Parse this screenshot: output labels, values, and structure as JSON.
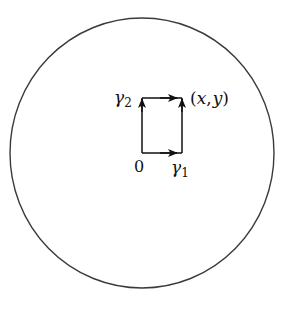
{
  "diagram": {
    "type": "path-integration-rectangle-in-disk",
    "colors": {
      "stroke": "#2a2a2a",
      "background": "#ffffff"
    },
    "disk": {
      "cx": 142,
      "cy": 153,
      "rx": 132,
      "ry": 135
    },
    "rectangle": {
      "x0": 142,
      "y0": 153,
      "x1": 182,
      "y1": 98
    },
    "labels": {
      "origin": "0",
      "gamma1": "γ",
      "gamma1_sub": "1",
      "gamma2": "γ",
      "gamma2_sub": "2",
      "point_open": "(",
      "point_x": "x",
      "point_comma": ",",
      "point_y": "y",
      "point_close": ")"
    },
    "paths": [
      {
        "name": "gamma1",
        "segments": [
          "0 → right along bottom",
          "up along right side to (x,y)"
        ]
      },
      {
        "name": "gamma2",
        "segments": [
          "0 → up along left side",
          "right along top to (x,y)"
        ]
      }
    ]
  }
}
